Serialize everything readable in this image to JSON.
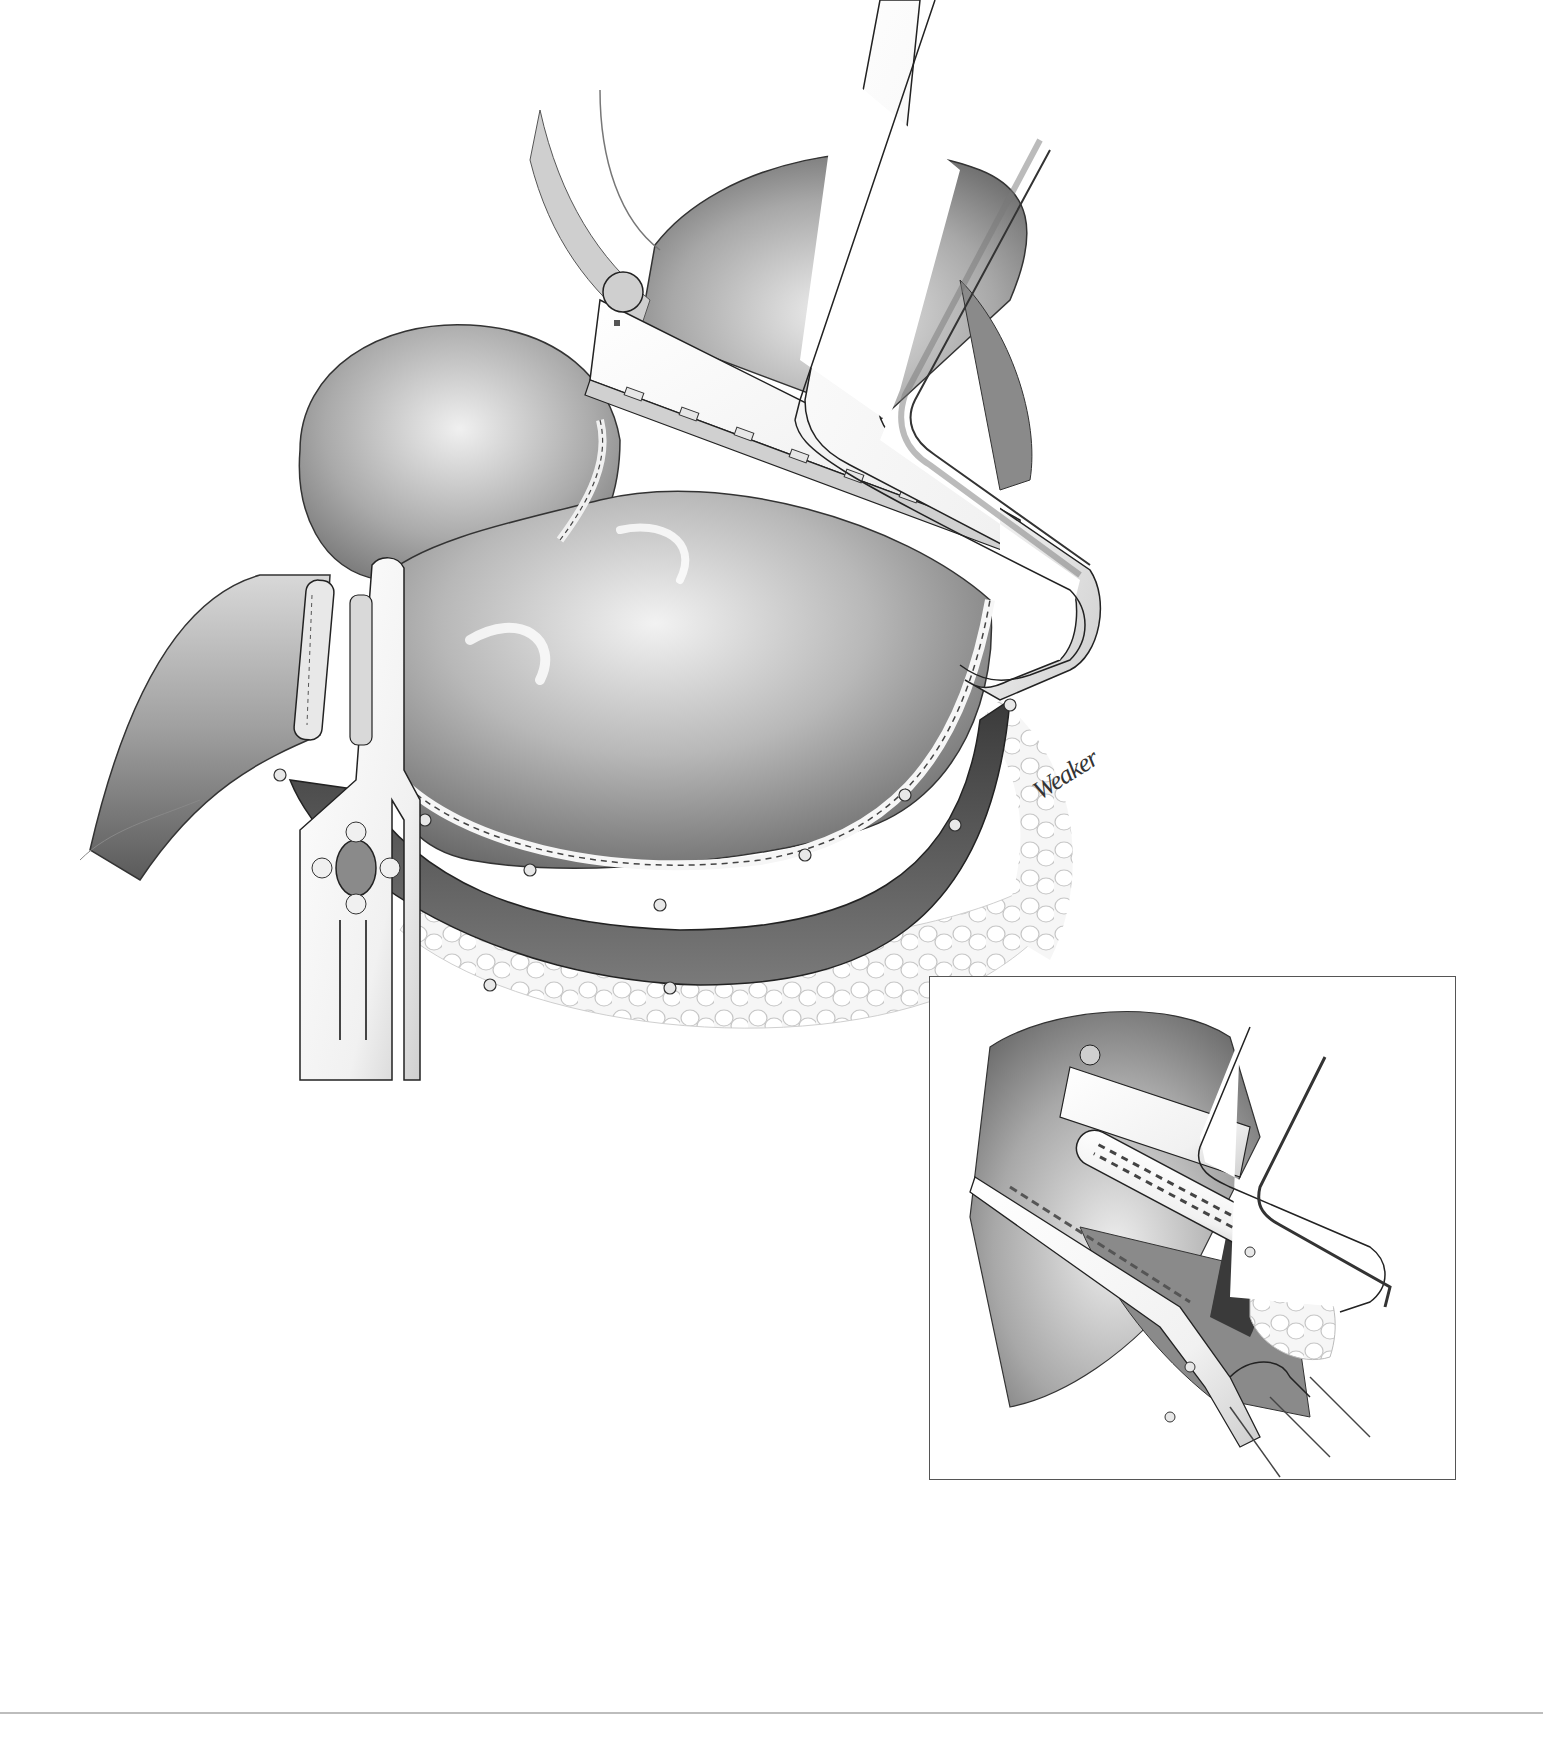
{
  "illustration": {
    "type": "surgical-illustration",
    "style": "grayscale pencil rendering",
    "subject": "stomach with linear stapler applied and bowel clamps",
    "signature": "Weaker",
    "colors": {
      "background": "#ffffff",
      "tissue_dark": "#4a4a4a",
      "tissue_mid": "#9a9a9a",
      "tissue_light": "#e6e6e6",
      "instrument": "#f4f4f4",
      "outline": "#222222",
      "rule": "#bdbdbd"
    }
  },
  "main_view": {
    "label": "main-surgical-view",
    "instruments": [
      "linear-stapler",
      "bowel-clamp-left",
      "bowel-clamp-right"
    ]
  },
  "inset": {
    "label": "detail-inset",
    "instruments": [
      "stapler-anvil-with-staple-rows",
      "forceps"
    ]
  }
}
